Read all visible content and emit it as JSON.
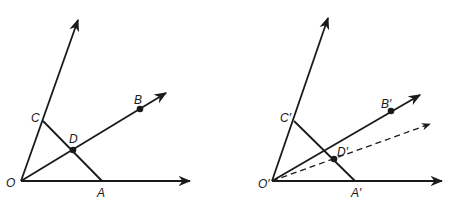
{
  "figures": [
    {
      "name": "original-angle",
      "labels": {
        "O": "O",
        "A": "A",
        "B": "B",
        "C": "C",
        "D": "D"
      },
      "points": {
        "O": [
          21,
          181
        ],
        "A": [
          102,
          181
        ],
        "C": [
          43,
          121
        ],
        "D": [
          73,
          150
        ],
        "B": [
          140,
          109
        ]
      },
      "rays": {
        "up_tip": [
          78,
          20
        ],
        "bisector_tip": [
          166,
          93
        ],
        "base_tip": [
          190,
          181
        ]
      }
    },
    {
      "name": "copied-angle",
      "labels": {
        "O": "O′",
        "A": "A′",
        "B": "B′",
        "C": "C′",
        "D": "D′"
      },
      "points": {
        "O": [
          272,
          181
        ],
        "A": [
          355,
          181
        ],
        "C": [
          294,
          121
        ],
        "D": [
          334,
          159
        ],
        "B": [
          391,
          111
        ]
      },
      "rays": {
        "up_tip": [
          328,
          18
        ],
        "ob_tip": [
          420,
          95
        ],
        "dashed_tip": [
          430,
          124
        ],
        "base_tip": [
          442,
          181
        ]
      }
    }
  ],
  "colors": {
    "ink": "#1a1a1a",
    "background": "#ffffff"
  }
}
